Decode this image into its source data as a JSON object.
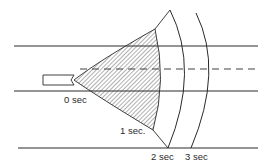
{
  "diagram": {
    "labels": {
      "t0": "0 sec",
      "t1": "1 sec.",
      "t2": "2 sec",
      "t3": "3 sec"
    },
    "colors": {
      "stroke": "#2a2a2a",
      "background": "#ffffff",
      "hatch": "#3a3a3a"
    }
  }
}
